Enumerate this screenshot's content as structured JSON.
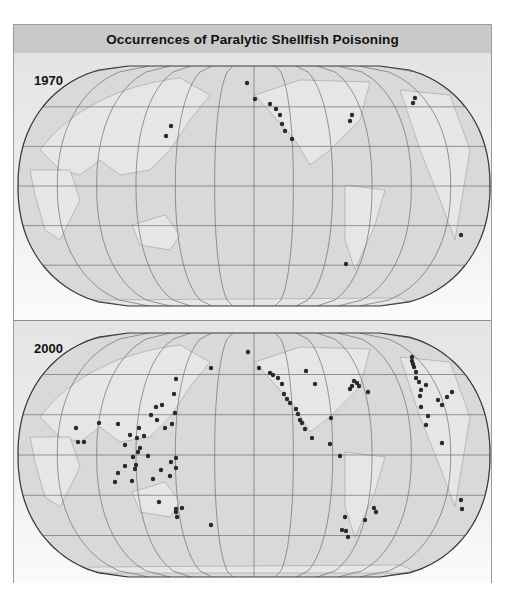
{
  "title": "Occurrences of Paralytic Shellfish Poisoning",
  "colors": {
    "header_bg": "#c9c9c9",
    "ocean": "#d9d9d9",
    "land_outline": "#a8a8a8",
    "graticule": "#6e6e6e",
    "map_border": "#3a3a3a",
    "dot": "#2a2a2a"
  },
  "panels": [
    {
      "year": "1970",
      "dots": [
        [
          247,
          83
        ],
        [
          171,
          126
        ],
        [
          166,
          136
        ],
        [
          255,
          99
        ],
        [
          270,
          104
        ],
        [
          276,
          109
        ],
        [
          280,
          115
        ],
        [
          282,
          124
        ],
        [
          285,
          131
        ],
        [
          292,
          139
        ],
        [
          352,
          115
        ],
        [
          350,
          121
        ],
        [
          415,
          98
        ],
        [
          413,
          103
        ],
        [
          346,
          264
        ],
        [
          461,
          235
        ]
      ]
    },
    {
      "year": "2000",
      "dots": [
        [
          248,
          352
        ],
        [
          211,
          368
        ],
        [
          176,
          379
        ],
        [
          174,
          394
        ],
        [
          175,
          413
        ],
        [
          172,
          424
        ],
        [
          156,
          407
        ],
        [
          162,
          405
        ],
        [
          151,
          415
        ],
        [
          157,
          420
        ],
        [
          165,
          428
        ],
        [
          144,
          436
        ],
        [
          139,
          428
        ],
        [
          137,
          438
        ],
        [
          140,
          448
        ],
        [
          138,
          452
        ],
        [
          130,
          435
        ],
        [
          118,
          424
        ],
        [
          125,
          445
        ],
        [
          76,
          428
        ],
        [
          78,
          442
        ],
        [
          84,
          442
        ],
        [
          99,
          423
        ],
        [
          133,
          457
        ],
        [
          136,
          465
        ],
        [
          118,
          473
        ],
        [
          125,
          466
        ],
        [
          148,
          456
        ],
        [
          161,
          470
        ],
        [
          171,
          462
        ],
        [
          176,
          458
        ],
        [
          170,
          476
        ],
        [
          176,
          468
        ],
        [
          153,
          479
        ],
        [
          115,
          482
        ],
        [
          132,
          481
        ],
        [
          135,
          469
        ],
        [
          159,
          502
        ],
        [
          176,
          512
        ],
        [
          176,
          509
        ],
        [
          182,
          508
        ],
        [
          177,
          517
        ],
        [
          211,
          525
        ],
        [
          259,
          368
        ],
        [
          270,
          373
        ],
        [
          273,
          375
        ],
        [
          278,
          378
        ],
        [
          282,
          384
        ],
        [
          284,
          394
        ],
        [
          287,
          399
        ],
        [
          290,
          403
        ],
        [
          296,
          409
        ],
        [
          298,
          414
        ],
        [
          300,
          420
        ],
        [
          302,
          423
        ],
        [
          305,
          429
        ],
        [
          312,
          438
        ],
        [
          330,
          444
        ],
        [
          340,
          456
        ],
        [
          331,
          418
        ],
        [
          306,
          371
        ],
        [
          315,
          384
        ],
        [
          350,
          389
        ],
        [
          352,
          386
        ],
        [
          354,
          381
        ],
        [
          357,
          383
        ],
        [
          359,
          386
        ],
        [
          368,
          392
        ],
        [
          412,
          357
        ],
        [
          412,
          361
        ],
        [
          413,
          364
        ],
        [
          414,
          367
        ],
        [
          416,
          372
        ],
        [
          416,
          378
        ],
        [
          419,
          382
        ],
        [
          421,
          390
        ],
        [
          426,
          385
        ],
        [
          420,
          396
        ],
        [
          421,
          407
        ],
        [
          428,
          416
        ],
        [
          426,
          425
        ],
        [
          438,
          400
        ],
        [
          442,
          405
        ],
        [
          447,
          397
        ],
        [
          452,
          392
        ],
        [
          442,
          443
        ],
        [
          461,
          500
        ],
        [
          462,
          509
        ],
        [
          345,
          517
        ],
        [
          376,
          512
        ],
        [
          374,
          508
        ],
        [
          365,
          520
        ],
        [
          342,
          530
        ],
        [
          346,
          531
        ],
        [
          348,
          537
        ]
      ]
    }
  ],
  "map": {
    "note_labels": []
  }
}
